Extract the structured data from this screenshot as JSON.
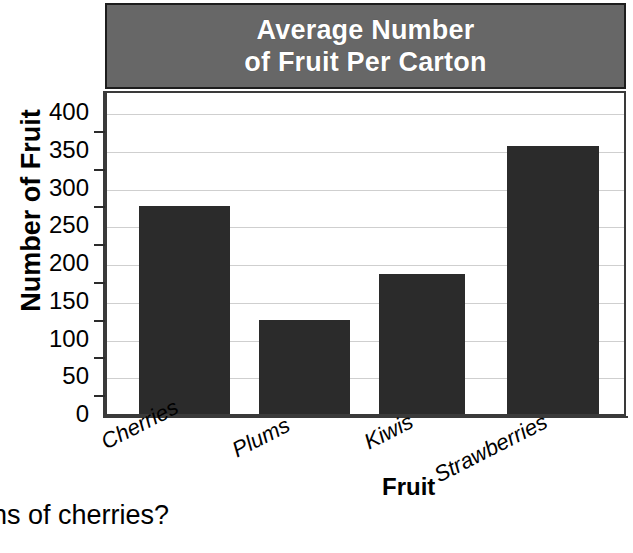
{
  "chart_data": {
    "type": "bar",
    "title": "Average Number of Fruit Per Carton",
    "title_lines": [
      "Average Number",
      "of Fruit Per Carton"
    ],
    "categories": [
      "Cherries",
      "Plums",
      "Kiwis",
      "Strawberries"
    ],
    "values": [
      275,
      125,
      185,
      355
    ],
    "xlabel": "Fruit",
    "ylabel": "Number of Fruit",
    "ylim": [
      0,
      400
    ],
    "ytick_labels": [
      "400",
      "350",
      "300",
      "250",
      "200",
      "150",
      "100",
      "50",
      "0"
    ],
    "ytick_values": [
      400,
      350,
      300,
      250,
      200,
      150,
      100,
      50,
      0
    ],
    "minor_tick_values": [
      375,
      325,
      275,
      225,
      175,
      125,
      75,
      25
    ],
    "grid": "horizontal",
    "legend": "none",
    "bar_color": "#2b2b2b",
    "title_band_color": "#676767",
    "title_text_color": "#ffffff",
    "gridline_color": "#cfcfcf",
    "axis_color": "#3a3a3a"
  },
  "page": {
    "question_fragment": "ns of cherries?"
  }
}
